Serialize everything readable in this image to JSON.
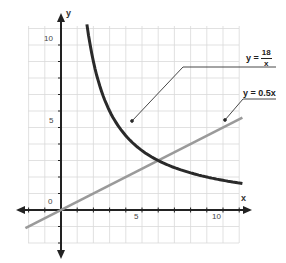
{
  "chart_data": {
    "type": "line",
    "title": "",
    "xlabel": "x",
    "ylabel": "y",
    "xlim": [
      -3,
      12
    ],
    "ylim": [
      -2,
      11
    ],
    "grid": true,
    "x_ticks": [
      5,
      10
    ],
    "y_ticks": [
      5,
      10
    ],
    "origin_label": "0",
    "series": [
      {
        "name": "y = 18/x",
        "label_lhs": "y =",
        "label_num": "18",
        "label_den": "x",
        "color": "#2a2a2a",
        "points": [
          [
            1.6,
            11.25
          ],
          [
            2,
            9
          ],
          [
            2.5,
            7.2
          ],
          [
            3,
            6
          ],
          [
            4,
            4.5
          ],
          [
            5,
            3.6
          ],
          [
            6,
            3
          ],
          [
            7,
            2.57
          ],
          [
            8,
            2.25
          ],
          [
            9,
            2
          ],
          [
            10,
            1.8
          ],
          [
            11.2,
            1.61
          ]
        ]
      },
      {
        "name": "y = 0.5x",
        "label": "y = 0.5x",
        "color": "#9a9a9a",
        "points": [
          [
            -2.2,
            -1.1
          ],
          [
            11.2,
            5.6
          ]
        ]
      }
    ],
    "intersection": [
      6,
      3
    ],
    "annotations": [
      {
        "text": "y = 18/x",
        "target": [
          4.4,
          5.4
        ]
      },
      {
        "text": "y = 0.5x",
        "target": [
          10.1,
          5.5
        ]
      }
    ]
  },
  "labels": {
    "x_axis": "x",
    "y_axis": "y",
    "origin": "0",
    "x_tick_5": "5",
    "x_tick_10": "10",
    "y_tick_5": "5",
    "y_tick_10": "10",
    "hyperbola_lhs": "y =",
    "hyperbola_num": "18",
    "hyperbola_den": "x",
    "line_label": "y = 0.5x"
  }
}
